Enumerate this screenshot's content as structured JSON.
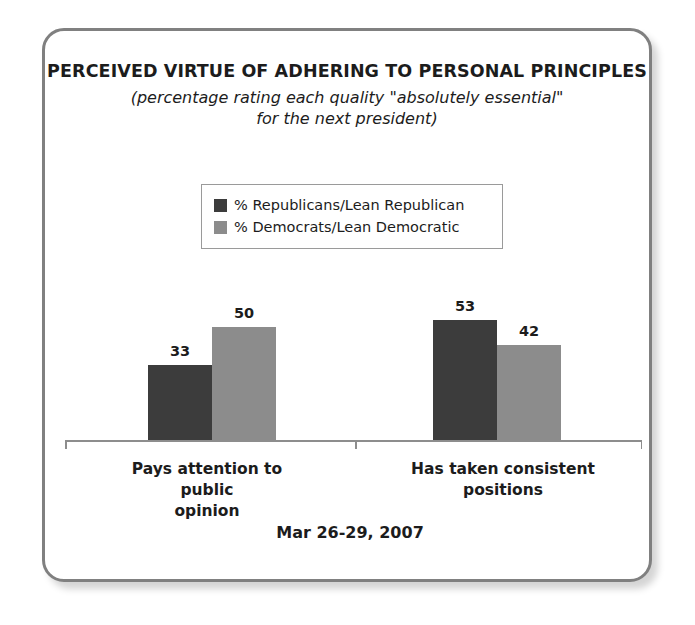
{
  "card": {
    "border_color": "#808080"
  },
  "header": {
    "title": "PERCEIVED VIRTUE OF ADHERING TO PERSONAL PRINCIPLES",
    "subtitle_line1": "(percentage rating each quality \"absolutely essential\"",
    "subtitle_line2": "for the next president)"
  },
  "footer": {
    "date": "Mar 26-29, 2007"
  },
  "chart_data": {
    "type": "bar",
    "title": "PERCEIVED VIRTUE OF ADHERING TO PERSONAL PRINCIPLES",
    "subtitle": "(percentage rating each quality \"absolutely essential\" for the next president)",
    "xlabel": "",
    "ylabel": "",
    "ylim": [
      0,
      60
    ],
    "grid": false,
    "legend_position": "top-center",
    "annotations": [
      "Mar 26-29, 2007"
    ],
    "categories": [
      "Pays attention to public opinion",
      "Has taken consistent positions"
    ],
    "category_lines": [
      [
        "Pays attention to public",
        "opinion"
      ],
      [
        "Has taken consistent",
        "positions"
      ]
    ],
    "series": [
      {
        "name": "% Republicans/Lean Republican",
        "color": "#3c3c3c",
        "values": [
          33,
          53
        ]
      },
      {
        "name": "% Democrats/Lean Democratic",
        "color": "#8c8c8c",
        "values": [
          50,
          42
        ]
      }
    ]
  }
}
